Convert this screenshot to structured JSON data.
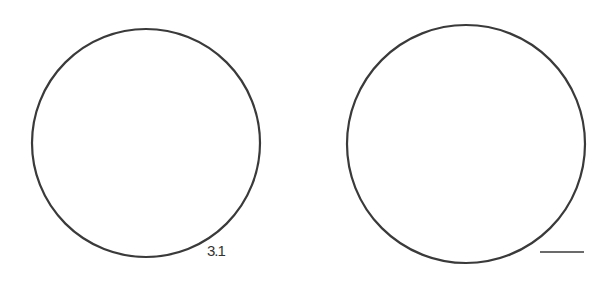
{
  "figure": {
    "circles": [
      {
        "name": "left-circle",
        "cx": 146,
        "cy": 143,
        "r": 114
      },
      {
        "name": "right-circle",
        "cx": 466,
        "cy": 144,
        "r": 119
      }
    ],
    "label": "3.1",
    "scale_bar": {
      "x1": 540,
      "x2": 584,
      "y": 252
    },
    "stroke_color": "#3a3a3a"
  }
}
